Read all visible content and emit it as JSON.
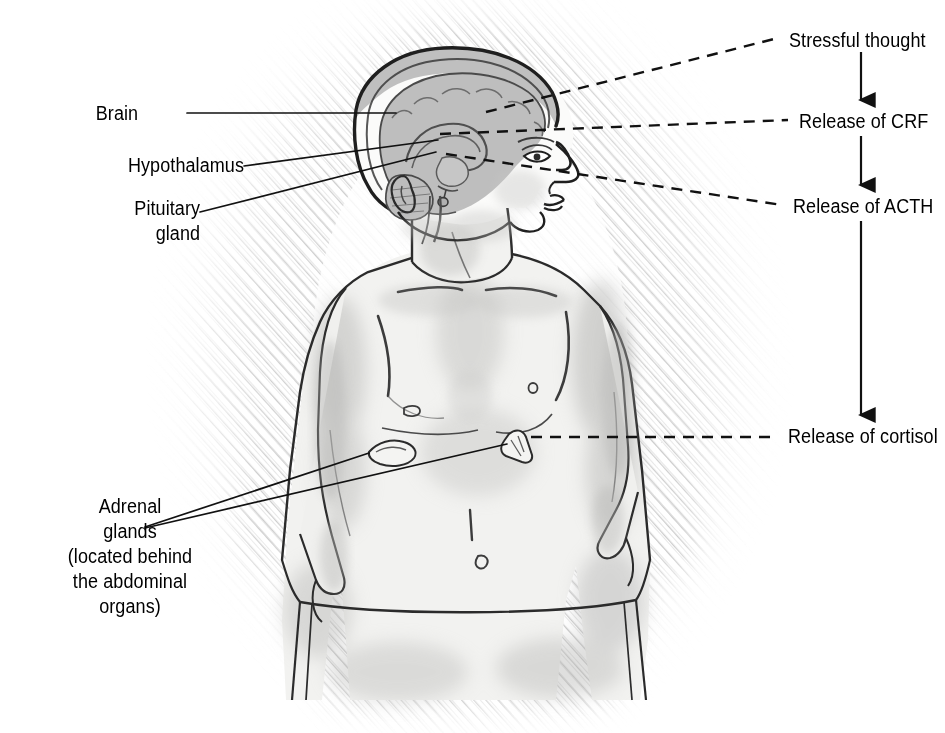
{
  "figure": {
    "background_color": "#ffffff",
    "ink_color": "#1a1a1a",
    "shade_color": "#a9a9a9"
  },
  "anatomy_labels": [
    {
      "id": "brain",
      "text": "Brain",
      "x": 138,
      "y": 113,
      "align": "l"
    },
    {
      "id": "hypothalamus",
      "text": "Hypothalamus",
      "x": 150,
      "y": 165,
      "align": "l"
    },
    {
      "id": "pituitary",
      "text": "Pituitary\ngland",
      "x": 139,
      "y": 208,
      "align": "l",
      "multiline": true
    }
  ],
  "adrenal_label": {
    "id": "adrenal-glands",
    "text": "Adrenal\nglands\n(located behind\nthe abdominal\norgans)",
    "x": 130,
    "y": 506,
    "align": "c"
  },
  "flow": {
    "steps": [
      {
        "id": "stressful-thought",
        "text": "Stressful thought",
        "x": 789,
        "y": 40
      },
      {
        "id": "release-crf",
        "text": "Release of CRF",
        "x": 799,
        "y": 121
      },
      {
        "id": "release-acth",
        "text": "Release of ACTH",
        "x": 793,
        "y": 206
      },
      {
        "id": "release-cortisol",
        "text": "Release of cortisol",
        "x": 788,
        "y": 436
      }
    ],
    "arrows": [
      {
        "id": "arrow-thought-to-crf",
        "x": 861,
        "y1": 52,
        "y2": 104
      },
      {
        "id": "arrow-crf-to-acth",
        "x": 861,
        "y1": 136,
        "y2": 189
      },
      {
        "id": "arrow-acth-to-cortisol",
        "x": 861,
        "y1": 221,
        "y2": 419
      }
    ]
  },
  "leader_lines": {
    "solid": [
      {
        "id": "leader-brain",
        "x1": 187,
        "y1": 113,
        "x2": 396,
        "y2": 113
      },
      {
        "id": "leader-hypothalamus",
        "x1": 244,
        "y1": 166,
        "x2": 432,
        "y2": 140
      },
      {
        "id": "leader-pituitary",
        "x1": 200,
        "y1": 212,
        "x2": 430,
        "y2": 152
      },
      {
        "id": "leader-adrenal-left",
        "x1": 145,
        "y1": 527,
        "x2": 369,
        "y2": 453
      },
      {
        "id": "leader-adrenal-right",
        "x1": 145,
        "y1": 528,
        "x2": 509,
        "y2": 443
      }
    ],
    "dashed": [
      {
        "id": "dash-stressful-thought",
        "x1": 482,
        "y1": 110,
        "x2": 778,
        "y2": 40
      },
      {
        "id": "dash-release-crf",
        "x1": 440,
        "y1": 133,
        "x2": 788,
        "y2": 122
      },
      {
        "id": "dash-release-acth",
        "x1": 432,
        "y1": 152,
        "x2": 782,
        "y2": 207
      },
      {
        "id": "dash-release-cortisol",
        "x1": 515,
        "y1": 437,
        "x2": 777,
        "y2": 437
      }
    ]
  }
}
